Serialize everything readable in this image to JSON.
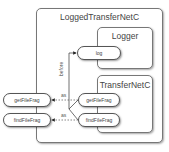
{
  "diagram": {
    "outer": {
      "title": "LoggedTransferNetC"
    },
    "logger": {
      "title": "Logger",
      "ports": [
        "log"
      ]
    },
    "transfer": {
      "title": "TransferNetC",
      "ports": [
        "getFileFrag",
        "findFileFrag"
      ]
    },
    "external_ports": [
      "getFileFrag",
      "findFileFrag"
    ],
    "edges": {
      "before_label": "before",
      "as_label_1": "as",
      "as_label_2": "as"
    }
  }
}
